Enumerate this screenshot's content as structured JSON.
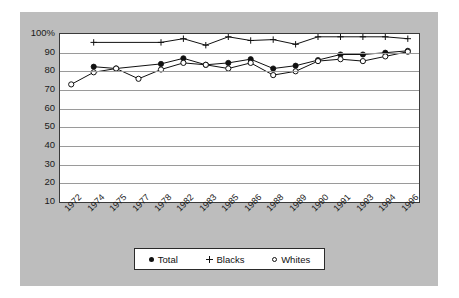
{
  "chart_data": {
    "type": "line",
    "title": "",
    "subtitle": "",
    "xlabel": "",
    "ylabel": "",
    "grid": true,
    "legend_position": "bottom",
    "ylim": [
      10,
      100
    ],
    "yticks": [
      10,
      20,
      30,
      40,
      50,
      60,
      70,
      80,
      90,
      100
    ],
    "ytick_labels": [
      "10",
      "20",
      "30",
      "40",
      "50",
      "60",
      "70",
      "80",
      "90",
      "100%"
    ],
    "categories": [
      "1972",
      "1974",
      "1975",
      "1977",
      "1978",
      "1982",
      "1983",
      "1985",
      "1986",
      "1988",
      "1989",
      "1990",
      "1991",
      "1993",
      "1994",
      "1996"
    ],
    "series": [
      {
        "name": "Total",
        "marker": "filled-circle",
        "color": "#111111",
        "values": [
          null,
          82.5,
          81.5,
          null,
          84,
          87,
          83.5,
          84.5,
          86.5,
          81.5,
          83,
          86,
          89,
          89,
          90,
          91
        ]
      },
      {
        "name": "Blacks",
        "marker": "plus",
        "color": "#111111",
        "values": [
          null,
          95.5,
          null,
          null,
          95.5,
          97.5,
          94,
          98.5,
          96.5,
          97,
          94.5,
          98.5,
          98.5,
          98.5,
          98.5,
          97.5
        ]
      },
      {
        "name": "Whites",
        "marker": "open-circle",
        "color": "#111111",
        "values": [
          73,
          79.5,
          81.5,
          76,
          81,
          84.5,
          83.5,
          81.5,
          84.5,
          78,
          80,
          85.5,
          86.5,
          85.5,
          88,
          90.5
        ]
      }
    ]
  },
  "legend": {
    "items": [
      {
        "label": "Total",
        "marker": "filled-circle"
      },
      {
        "label": "Blacks",
        "marker": "plus"
      },
      {
        "label": "Whites",
        "marker": "open-circle"
      }
    ]
  },
  "colors": {
    "panel_background": "#bdbdbd",
    "plot_background": "#ffffff",
    "axis": "#3a3a3a",
    "gridline": "#9a9a9a",
    "series": "#111111"
  }
}
